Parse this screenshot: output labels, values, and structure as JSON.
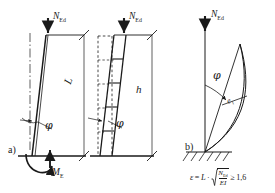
{
  "figure": {
    "background_color": "#ffffff",
    "line_color": "#1a1a1a",
    "panels": [
      {
        "id": "a",
        "tag": "a)",
        "description": "tilted-column-with-base-moment",
        "labels": {
          "load": "N",
          "load_sub": "Ed",
          "length": "L",
          "angle": "φ",
          "moment": "M",
          "moment_sub": "E"
        }
      },
      {
        "id": "middle",
        "tag": "",
        "description": "segmented-tilted-column-height-h",
        "labels": {
          "load": "N",
          "load_sub": "Ed",
          "height": "h",
          "angle": "φ"
        }
      },
      {
        "id": "b",
        "tag": "b)",
        "description": "buckled-column-fixed-base",
        "labels": {
          "load": "N",
          "load_sub": "Ed",
          "angle": "φ",
          "eccentricity": "e",
          "eccentricity_sub": "1"
        }
      }
    ],
    "formula": {
      "lhs": "ε",
      "equals": "=",
      "factor": "L",
      "dot": "·",
      "numerator": "N",
      "numerator_sub": "Ed",
      "denominator": "EI",
      "relation": "≥",
      "limit": "1,6",
      "plain": "ε = L · √(N_Ed / EI) ≥ 1,6"
    }
  }
}
